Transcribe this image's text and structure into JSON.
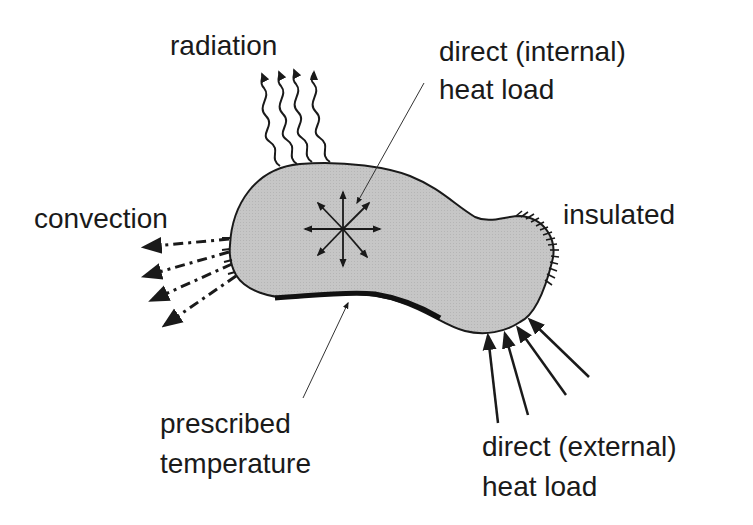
{
  "diagram": {
    "type": "heat-transfer-boundary-conditions",
    "labels": {
      "radiation": "radiation",
      "internal_load_line1": "direct (internal)",
      "internal_load_line2": "heat load",
      "convection": "convection",
      "insulated": "insulated",
      "prescribed_line1": "prescribed",
      "prescribed_line2": "temperature",
      "external_load_line1": "direct (external)",
      "external_load_line2": "heat load"
    },
    "colors": {
      "body_fill": "#c4c4c4",
      "stroke": "#1a1a1a",
      "background": "#ffffff"
    }
  }
}
